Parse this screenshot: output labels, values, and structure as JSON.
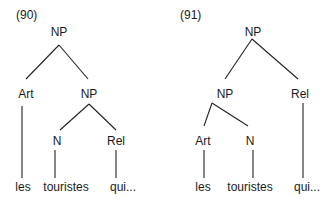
{
  "trees": [
    {
      "number": "(90)",
      "nodes": {
        "root": "NP",
        "art": "Art",
        "np": "NP",
        "n": "N",
        "rel": "Rel"
      },
      "words": {
        "les": "les",
        "touristes": "touristes",
        "qui": "qui..."
      }
    },
    {
      "number": "(91)",
      "nodes": {
        "root": "NP",
        "np": "NP",
        "rel": "Rel",
        "art": "Art",
        "n": "N"
      },
      "words": {
        "les": "les",
        "touristes": "touristes",
        "qui": "qui..."
      }
    }
  ],
  "colors": {
    "line": "#222222",
    "text": "#1a1a1a",
    "background": "#ffffff"
  }
}
